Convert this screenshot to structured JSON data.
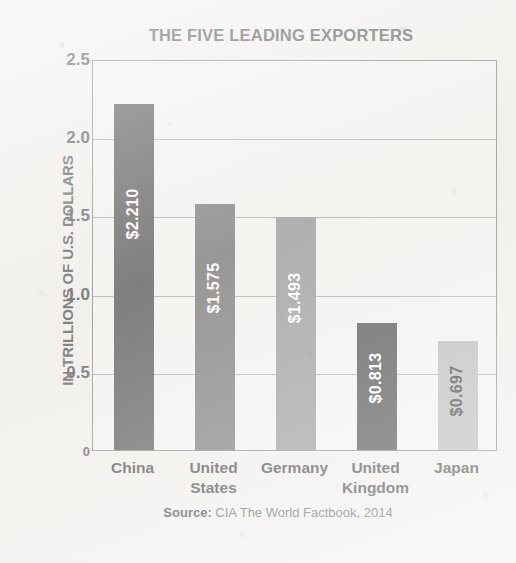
{
  "chart_data": {
    "type": "bar",
    "title": "THE FIVE LEADING EXPORTERS",
    "xlabel": "",
    "ylabel": "IN TRILLIONS OF U.S. DOLLARS",
    "categories": [
      "China",
      "United States",
      "Germany",
      "United Kingdom",
      "Japan"
    ],
    "category_lines": [
      [
        "China"
      ],
      [
        "United",
        "States"
      ],
      [
        "Germany"
      ],
      [
        "United",
        "Kingdom"
      ],
      [
        "Japan"
      ]
    ],
    "values": [
      2.21,
      1.575,
      1.493,
      0.813,
      0.697
    ],
    "data_labels": [
      "$2.210",
      "$1.575",
      "$1.493",
      "$0.813",
      "$0.697"
    ],
    "bar_colors": [
      "#5a5a5a",
      "#7b7b7b",
      "#9b9b9b",
      "#4e4e4e",
      "#bcbcbc"
    ],
    "label_text_colors": [
      "#ffffff",
      "#ffffff",
      "#ffffff",
      "#ffffff",
      "#3c3c3c"
    ],
    "ylim": [
      0,
      2.5
    ],
    "yticks": [
      0,
      0.5,
      1.0,
      1.5,
      2.0,
      2.5
    ],
    "ytick_labels": [
      "0",
      "0.5",
      "1.0",
      "1.5",
      "2.0",
      "2.5"
    ],
    "grid": true,
    "legend": "none"
  },
  "source": {
    "prefix": "Source:",
    "text": "CIA The World Factbook, 2014"
  }
}
